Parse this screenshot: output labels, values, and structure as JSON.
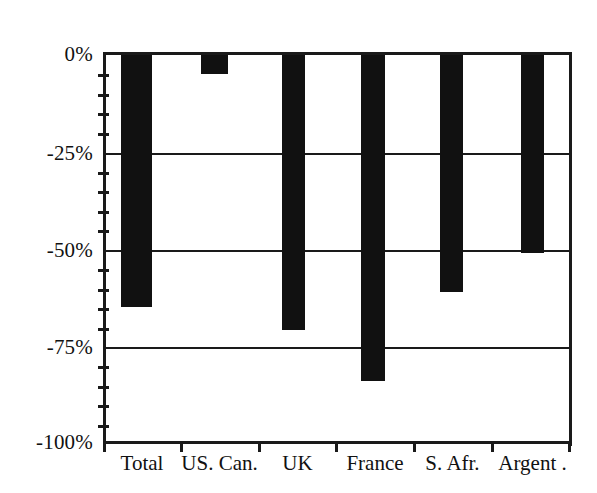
{
  "chart_data": {
    "type": "bar",
    "title": "",
    "subtitle": "",
    "xlabel": "",
    "ylabel": "",
    "categories": [
      "Total",
      "US. Can.",
      "UK",
      "France",
      "S. Afr.",
      "Argent ."
    ],
    "values": [
      -65,
      -5,
      -71,
      -84,
      -61,
      -51
    ],
    "value_labels": [
      "-65%",
      "-5%",
      "-71%",
      "-84%",
      "-61%",
      "-51%"
    ],
    "ylim": [
      -100,
      0
    ],
    "y_ticks": [
      0,
      -25,
      -50,
      -75,
      -100
    ],
    "y_tick_labels": [
      "0%",
      "-25%",
      "-50%",
      "-75%",
      "-100%"
    ],
    "y_minor_tick_step": 5,
    "grid": true,
    "grid_axis": "y",
    "legend": "none",
    "series": [
      {
        "name": "",
        "values": [
          -65,
          -5,
          -71,
          -84,
          -61,
          -51
        ]
      }
    ],
    "bar_color": "#111111",
    "axis_color": "#1a1a1a",
    "background_color": "#ffffff"
  },
  "axes": {
    "y_labels": [
      {
        "text": "0%",
        "value": 0
      },
      {
        "text": "-25%",
        "value": -25
      },
      {
        "text": "-50%",
        "value": -50
      },
      {
        "text": "-75%",
        "value": -75
      },
      {
        "text": "-100%",
        "value": -100
      }
    ],
    "x_labels": [
      {
        "text": "Total"
      },
      {
        "text": "US. Can."
      },
      {
        "text": "UK"
      },
      {
        "text": "France"
      },
      {
        "text": "S. Afr."
      },
      {
        "text": "Argent ."
      }
    ]
  }
}
